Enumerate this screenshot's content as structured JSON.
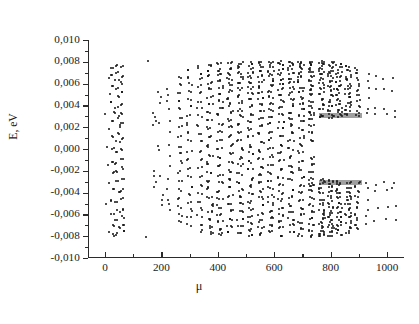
{
  "figure": {
    "kind": "scatter-spectrum",
    "background_color": "#ffffff",
    "point_color": "#111111",
    "axis_color": "#2b2b2b"
  },
  "axes": {
    "y_title": "E, eV",
    "x_title": "μ",
    "y_tick_labels": [
      "0,010",
      "0,008",
      "0,006",
      "0,004",
      "0,002",
      "0,000",
      "-0,002",
      "-0,004",
      "-0,006",
      "-0,008",
      "-0,010"
    ],
    "y_tick_values": [
      0.01,
      0.008,
      0.006,
      0.004,
      0.002,
      0.0,
      -0.002,
      -0.004,
      -0.006,
      -0.008,
      -0.01
    ],
    "x_tick_labels": [
      "0",
      "200",
      "400",
      "600",
      "800",
      "1000"
    ],
    "x_tick_values": [
      0,
      200,
      400,
      600,
      800,
      1000
    ],
    "x_minor_values": [
      100,
      300,
      500,
      700,
      900
    ],
    "y_minor_values": [
      0.009,
      0.007,
      0.005,
      0.003,
      0.001,
      -0.001,
      -0.003,
      -0.005,
      -0.007,
      -0.009
    ],
    "frame": "left-and-bottom-only",
    "tick_direction": "outward",
    "grid": false,
    "legend": null
  },
  "chart_data": {
    "type": "scatter",
    "title": "",
    "xlabel": "μ",
    "ylabel": "E, eV",
    "xlim": [
      -60,
      1060
    ],
    "ylim": [
      -0.01,
      0.01
    ],
    "grid": false,
    "legend_position": "none",
    "symmetry": "approximately symmetric about E = 0",
    "columns": [
      {
        "mu": 10,
        "values": [
          0.0066,
          0.0051,
          0.0031,
          0.0018,
          0.0002,
          -0.0014,
          -0.0031,
          -0.0052,
          -0.0077
        ]
      },
      {
        "mu": 28,
        "values": [
          0.0074,
          0.0069,
          0.0058,
          0.0042,
          0.0034,
          0.0026,
          0.0012,
          0.0001,
          -0.0012,
          -0.0022,
          -0.0036,
          -0.0048,
          -0.006,
          -0.0071,
          -0.0079
        ]
      },
      {
        "mu": 45,
        "values": [
          0.0076,
          0.007,
          0.0063,
          0.0055,
          0.0048,
          0.0038,
          0.0029,
          0.0021,
          0.0014,
          0.0006,
          -0.0004,
          -0.0013,
          -0.0021,
          -0.003,
          -0.004,
          -0.0049,
          -0.0057,
          -0.0066,
          -0.0073,
          -0.0078
        ]
      },
      {
        "mu": 62,
        "values": [
          0.0075,
          0.0067,
          0.006,
          0.0052,
          0.004,
          0.0032,
          0.0024,
          0.001,
          0.0,
          -0.0009,
          -0.0018,
          -0.0028,
          -0.0038,
          -0.0046,
          -0.0055,
          -0.0063,
          -0.007,
          -0.0076
        ]
      },
      {
        "mu": 150,
        "values": [
          0.008,
          -0.008
        ]
      },
      {
        "mu": 172,
        "values": [
          0.0033,
          0.003,
          0.0026,
          0.0021,
          -0.0021,
          -0.0026,
          -0.003,
          -0.0034
        ]
      },
      {
        "mu": 196,
        "values": [
          0.0051,
          0.0047,
          0.0043,
          0.0024,
          0.0002,
          -0.0002,
          -0.0024,
          -0.0042,
          -0.0047,
          -0.0052
        ]
      },
      {
        "mu": 226,
        "values": [
          0.0055,
          0.005,
          0.0045,
          0.0036,
          0.0026,
          0.0016,
          0.0005,
          -0.0006,
          -0.0016,
          -0.0027,
          -0.0037,
          -0.0046,
          -0.0051,
          -0.0056
        ]
      },
      {
        "mu": 266,
        "values": [
          0.0066,
          0.0059,
          0.0052,
          0.0045,
          0.0037,
          0.0029,
          0.002,
          0.0011,
          0.0002,
          -0.0003,
          -0.0012,
          -0.0021,
          -0.003,
          -0.0038,
          -0.0046,
          -0.0053,
          -0.006,
          -0.0067
        ]
      },
      {
        "mu": 300,
        "values": [
          0.0072,
          0.0066,
          0.006,
          0.0053,
          0.0046,
          0.0039,
          0.0031,
          0.0023,
          0.0015,
          0.0007,
          -0.0002,
          -0.001,
          -0.0018,
          -0.0026,
          -0.0034,
          -0.0042,
          -0.0049,
          -0.0056,
          -0.0063,
          -0.007
        ]
      },
      {
        "mu": 336,
        "values": [
          0.0075,
          0.007,
          0.0064,
          0.0058,
          0.0051,
          0.0044,
          0.0037,
          0.003,
          0.0022,
          0.0014,
          0.0006,
          -0.0002,
          -0.0009,
          -0.0017,
          -0.0025,
          -0.0033,
          -0.0041,
          -0.0048,
          -0.0055,
          -0.0062,
          -0.0069,
          -0.0075
        ]
      },
      {
        "mu": 372,
        "values": [
          0.0077,
          0.0072,
          0.0067,
          0.0061,
          0.0055,
          0.0048,
          0.0041,
          0.0034,
          0.0027,
          0.0019,
          0.0011,
          0.0003,
          -0.0005,
          -0.0013,
          -0.0021,
          -0.0029,
          -0.0036,
          -0.0044,
          -0.0051,
          -0.0058,
          -0.0065,
          -0.0071,
          -0.0077
        ]
      },
      {
        "mu": 408,
        "values": [
          0.0078,
          0.0073,
          0.0068,
          0.0063,
          0.0057,
          0.0051,
          0.0044,
          0.0038,
          0.0031,
          0.0023,
          0.0016,
          0.0008,
          0.0,
          -0.0008,
          -0.0016,
          -0.0024,
          -0.0031,
          -0.0039,
          -0.0046,
          -0.0053,
          -0.006,
          -0.0067,
          -0.0073,
          -0.0078
        ]
      },
      {
        "mu": 444,
        "values": [
          0.0079,
          0.0074,
          0.0069,
          0.0064,
          0.0059,
          0.0053,
          0.0047,
          0.0041,
          0.0034,
          0.0027,
          0.002,
          0.0012,
          0.0004,
          -0.0004,
          -0.0012,
          -0.002,
          -0.0028,
          -0.0035,
          -0.0043,
          -0.005,
          -0.0057,
          -0.0064,
          -0.007,
          -0.0076
        ]
      },
      {
        "mu": 480,
        "values": [
          0.0079,
          0.0075,
          0.007,
          0.0065,
          0.006,
          0.0055,
          0.0049,
          0.0043,
          0.0036,
          0.003,
          0.0023,
          0.0015,
          0.0008,
          0.0,
          -0.0008,
          -0.0015,
          -0.0023,
          -0.003,
          -0.0037,
          -0.0044,
          -0.0051,
          -0.0058,
          -0.0065,
          -0.0071,
          -0.0077
        ]
      },
      {
        "mu": 516,
        "values": [
          0.0079,
          0.0075,
          0.0071,
          0.0066,
          0.0061,
          0.0056,
          0.0051,
          0.0045,
          0.0039,
          0.0032,
          0.0025,
          0.0018,
          0.0011,
          0.0003,
          -0.0004,
          -0.0012,
          -0.0019,
          -0.0027,
          -0.0034,
          -0.0041,
          -0.0048,
          -0.0055,
          -0.0062,
          -0.0068,
          -0.0074,
          -0.0079
        ]
      },
      {
        "mu": 552,
        "values": [
          0.008,
          0.0076,
          0.0071,
          0.0067,
          0.0062,
          0.0057,
          0.0052,
          0.0047,
          0.0041,
          0.0034,
          0.0028,
          0.0021,
          0.0014,
          0.0006,
          -0.0002,
          -0.0009,
          -0.0017,
          -0.0024,
          -0.0031,
          -0.0038,
          -0.0045,
          -0.0052,
          -0.0059,
          -0.0066,
          -0.0072,
          -0.0078
        ]
      },
      {
        "mu": 588,
        "values": [
          0.008,
          0.0076,
          0.0072,
          0.0068,
          0.0063,
          0.0058,
          0.0053,
          0.0048,
          0.0042,
          0.0036,
          0.003,
          0.0023,
          0.0016,
          0.0009,
          0.0001,
          -0.0007,
          -0.0014,
          -0.0022,
          -0.0029,
          -0.0036,
          -0.0043,
          -0.005,
          -0.0057,
          -0.0063,
          -0.007,
          -0.0076
        ]
      },
      {
        "mu": 624,
        "values": [
          0.008,
          0.0077,
          0.0073,
          0.0069,
          0.0064,
          0.006,
          0.0055,
          0.0049,
          0.0044,
          0.0038,
          0.0032,
          0.0025,
          0.0019,
          0.0012,
          0.0004,
          -0.0003,
          -0.0011,
          -0.0018,
          -0.0026,
          -0.0033,
          -0.004,
          -0.0047,
          -0.0054,
          -0.0061,
          -0.0067,
          -0.0073,
          -0.0079
        ]
      },
      {
        "mu": 660,
        "values": [
          0.008,
          0.0077,
          0.0073,
          0.0069,
          0.0065,
          0.0061,
          0.0056,
          0.0051,
          0.0046,
          0.004,
          0.0034,
          0.0028,
          0.0022,
          0.0015,
          0.0008,
          0.0,
          -0.0007,
          -0.0015,
          -0.0022,
          -0.0029,
          -0.0037,
          -0.0044,
          -0.0051,
          -0.0057,
          -0.0064,
          -0.007,
          -0.0076
        ]
      },
      {
        "mu": 696,
        "values": [
          0.008,
          0.0077,
          0.0074,
          0.007,
          0.0066,
          0.0062,
          0.0057,
          0.0052,
          0.0047,
          0.0042,
          0.0036,
          0.0031,
          0.0025,
          0.0018,
          0.0011,
          0.0004,
          -0.0003,
          -0.0011,
          -0.0018,
          -0.0026,
          -0.0033,
          -0.004,
          -0.0047,
          -0.0054,
          -0.0061,
          -0.0067,
          -0.0073,
          -0.0079
        ]
      },
      {
        "mu": 732,
        "values": [
          0.008,
          0.0078,
          0.0074,
          0.0071,
          0.0067,
          0.0063,
          0.0059,
          0.0054,
          0.0049,
          0.0044,
          0.0039,
          0.0033,
          0.0027,
          0.0021,
          0.0015,
          0.0008,
          0.0032,
          -0.0032,
          -0.0008,
          -0.0015,
          -0.0021,
          -0.0027,
          -0.0033,
          -0.0039,
          -0.0045,
          -0.0051,
          -0.0057,
          -0.0063,
          -0.0069,
          -0.0075,
          -0.008
        ]
      },
      {
        "mu": 768,
        "values": [
          0.008,
          0.0078,
          0.0075,
          0.0072,
          0.0068,
          0.0064,
          0.006,
          0.0056,
          0.0051,
          0.0046,
          0.0041,
          0.0036,
          0.0031,
          0.0029,
          -0.0029,
          -0.0031,
          -0.0036,
          -0.0041,
          -0.0046,
          -0.0051,
          -0.0056,
          -0.006,
          -0.0064,
          -0.0068,
          -0.0072,
          -0.0075,
          -0.0078,
          -0.008
        ]
      },
      {
        "mu": 800,
        "values": [
          0.0079,
          0.0076,
          0.0073,
          0.007,
          0.0066,
          0.0062,
          0.0058,
          0.0054,
          0.0049,
          0.0044,
          0.0039,
          0.0035,
          0.0031,
          0.0029,
          -0.0029,
          -0.0031,
          -0.0035,
          -0.0039,
          -0.0044,
          -0.0049,
          -0.0054,
          -0.0058,
          -0.0062,
          -0.0066,
          -0.007,
          -0.0073,
          -0.0076,
          -0.0079
        ]
      },
      {
        "mu": 830,
        "values": [
          0.0078,
          0.0074,
          0.007,
          0.0066,
          0.0062,
          0.0058,
          0.0054,
          0.005,
          0.0045,
          0.0041,
          0.0037,
          0.0033,
          0.003,
          -0.003,
          -0.0033,
          -0.0037,
          -0.0041,
          -0.0045,
          -0.005,
          -0.0054,
          -0.0058,
          -0.0062,
          -0.0066,
          -0.007,
          -0.0074,
          -0.0078
        ]
      },
      {
        "mu": 862,
        "values": [
          0.0076,
          0.0072,
          0.0067,
          0.0063,
          0.0059,
          0.0055,
          0.0051,
          0.0047,
          0.0043,
          0.0039,
          0.0035,
          0.0031,
          -0.0031,
          -0.0035,
          -0.0039,
          -0.0043,
          -0.0047,
          -0.0051,
          -0.0055,
          -0.0059,
          -0.0063,
          -0.0067,
          -0.0072,
          -0.0076
        ]
      },
      {
        "mu": 894,
        "values": [
          0.0073,
          0.0069,
          0.0064,
          0.0059,
          0.0054,
          0.0049,
          0.0044,
          0.0039,
          0.0034,
          0.0031,
          -0.0031,
          -0.0034,
          -0.0039,
          -0.0044,
          -0.0049,
          -0.0054,
          -0.0059,
          -0.0064,
          -0.0069,
          -0.0073
        ]
      },
      {
        "mu": 930,
        "values": [
          0.0068,
          0.0062,
          0.0055,
          0.0046,
          0.0037,
          0.0032,
          -0.0032,
          -0.0037,
          -0.0046,
          -0.0055,
          -0.0062,
          -0.0068
        ]
      },
      {
        "mu": 962,
        "values": [
          0.0066,
          0.0055,
          0.0038,
          0.0032,
          -0.0032,
          -0.0038,
          -0.0055,
          -0.0066
        ]
      },
      {
        "mu": 996,
        "values": [
          0.0065,
          0.0054,
          0.0037,
          0.0031,
          -0.0031,
          -0.0037,
          -0.0054,
          -0.0065
        ]
      },
      {
        "mu": 1026,
        "values": [
          0.0064,
          0.0053,
          0.0036,
          0.003,
          -0.003,
          -0.0036,
          -0.0053,
          -0.0064
        ]
      }
    ]
  }
}
